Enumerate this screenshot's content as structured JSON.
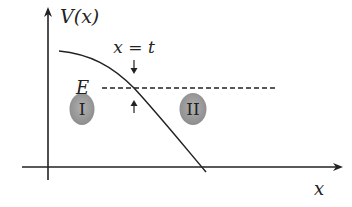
{
  "diagram": {
    "type": "potential-energy-diagram",
    "y_axis_label": "V(x)",
    "x_axis_label": "x",
    "energy_label": "E",
    "turning_point_label": "x = t",
    "regions": [
      {
        "label": "I",
        "position": "left of turning point"
      },
      {
        "label": "II",
        "position": "right of turning point"
      }
    ],
    "curve": "monotonically decreasing potential V(x) crossing energy level E at x = t",
    "colors": {
      "line": "#222222",
      "region_fill": "#9a9a9a",
      "background": "#ffffff"
    }
  }
}
